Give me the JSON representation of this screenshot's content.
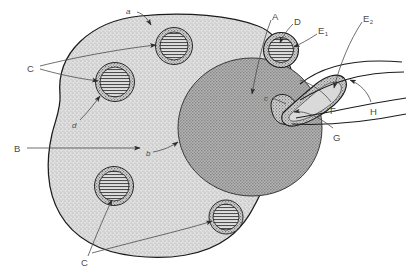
{
  "figure": {
    "colors": {
      "outline": "#1a1a1a",
      "cytoplasm": "#d8d8d8",
      "nucleus": "#9a9a9a",
      "organelle_fill": "#cfcfcf",
      "leader_line": "#4a4a4a",
      "label_text": "#4a4a4a",
      "background": "#ffffff"
    }
  },
  "labels": {
    "uppercase": [
      {
        "id": "label-a",
        "text": "A",
        "x": 272,
        "y": 12
      },
      {
        "id": "label-b",
        "text": "B",
        "x": 14,
        "y": 144
      },
      {
        "id": "label-c1",
        "text": "C",
        "x": 27,
        "y": 64
      },
      {
        "id": "label-c2",
        "text": "C",
        "x": 81,
        "y": 258
      },
      {
        "id": "label-d",
        "text": "D",
        "x": 294,
        "y": 17
      },
      {
        "id": "label-f",
        "text": "F",
        "x": 330,
        "y": 106
      },
      {
        "id": "label-g",
        "text": "G",
        "x": 333,
        "y": 133
      },
      {
        "id": "label-h",
        "text": "H",
        "x": 370,
        "y": 107
      }
    ],
    "subscripted": [
      {
        "id": "label-e1",
        "base": "E",
        "sub": "1",
        "x": 318,
        "y": 26
      },
      {
        "id": "label-e2",
        "base": "E",
        "sub": "2",
        "x": 363,
        "y": 14
      }
    ],
    "lowercase": [
      {
        "id": "label-a-lower",
        "text": "a",
        "x": 126,
        "y": 8
      },
      {
        "id": "label-b-lower",
        "text": "b",
        "x": 146,
        "y": 150
      },
      {
        "id": "label-c-lower",
        "text": "c",
        "x": 264,
        "y": 95
      },
      {
        "id": "label-d-lower",
        "text": "d",
        "x": 72,
        "y": 122
      }
    ]
  },
  "structures": [
    {
      "id": "cell-body",
      "name": "cell-outline",
      "label": "a"
    },
    {
      "id": "nucleus",
      "name": "nucleus",
      "label": "b"
    },
    {
      "id": "inclusion-1",
      "name": "inclusion-body-top",
      "label": "C"
    },
    {
      "id": "inclusion-2",
      "name": "inclusion-body-upper-left",
      "label": "C"
    },
    {
      "id": "inclusion-3",
      "name": "inclusion-body-lower-left",
      "label": "C"
    },
    {
      "id": "inclusion-4",
      "name": "inclusion-body-bottom",
      "label": "C"
    },
    {
      "id": "detached-organelle",
      "name": "detached-organelle",
      "label": "D"
    },
    {
      "id": "elongate-body",
      "name": "elongate-appendage",
      "label": "E2"
    },
    {
      "id": "neck-region",
      "name": "neck-connection",
      "label": "G"
    },
    {
      "id": "filament-1",
      "name": "filament-upper",
      "label": "E1"
    },
    {
      "id": "filament-2",
      "name": "filament-lower",
      "label": "H"
    }
  ]
}
